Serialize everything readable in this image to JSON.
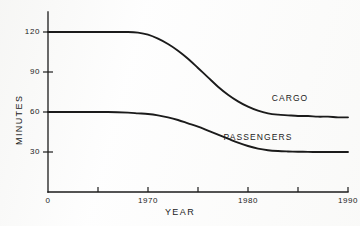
{
  "chart_data": {
    "type": "line",
    "title": "",
    "subtitle": "",
    "xlabel": "YEAR",
    "ylabel": "MINUTES",
    "xlim": [
      1960,
      1990
    ],
    "ylim": [
      0,
      135
    ],
    "grid": false,
    "legend_position": "inline-right-of-curve",
    "x_tick_labels": [
      "0",
      "",
      "1970",
      "",
      "1980",
      "",
      "1990"
    ],
    "x_tick_values": [
      1960,
      1965,
      1970,
      1975,
      1980,
      1985,
      1990
    ],
    "y_tick_labels": [
      "30",
      "60",
      "90",
      "120"
    ],
    "y_tick_values": [
      30,
      60,
      90,
      120
    ],
    "x": [
      1960,
      1962,
      1964,
      1966,
      1968,
      1969,
      1970,
      1971,
      1972,
      1973,
      1974,
      1975,
      1976,
      1977,
      1978,
      1979,
      1980,
      1981,
      1982,
      1983,
      1984,
      1985,
      1986,
      1987,
      1988,
      1989,
      1990
    ],
    "series": [
      {
        "name": "CARGO",
        "label": "CARGO",
        "color": "#1b1b1b",
        "values": [
          120,
          120,
          120,
          120,
          120,
          119.5,
          118,
          115,
          111,
          106,
          100,
          93,
          86,
          79,
          73,
          68,
          64,
          61,
          59,
          58,
          57.5,
          57,
          57,
          56.5,
          56.5,
          56,
          56
        ]
      },
      {
        "name": "PASSENGERS",
        "label": "PASSENGERS",
        "color": "#1b1b1b",
        "values": [
          60,
          60,
          60,
          60,
          59.5,
          59,
          58.5,
          57.5,
          56,
          54,
          51.5,
          49,
          46,
          43,
          40,
          37,
          34.5,
          32.5,
          31.3,
          30.7,
          30.4,
          30.2,
          30.1,
          30,
          30,
          30,
          30
        ]
      }
    ],
    "annotations": [
      {
        "text": "CARGO",
        "x": 1984.2,
        "y": 70
      },
      {
        "text": "PASSENGERS",
        "x": 1981.0,
        "y": 40.5
      }
    ]
  },
  "axes": {
    "x_title": "YEAR",
    "y_title": "MINUTES"
  }
}
